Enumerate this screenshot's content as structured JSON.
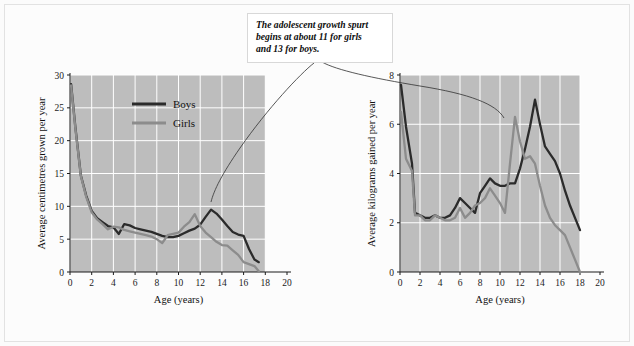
{
  "figure": {
    "background_color": "#fbfbfb",
    "frame_color": "#e2e2e2",
    "plot_background_color": "#bdbdbd",
    "gridline_color": "#ffffff",
    "boys_color": "#2b2b2b",
    "girls_color": "#8c8c8c"
  },
  "annotation": {
    "name": "growth-spurt-callout",
    "line1": "The adolescent growth spurt",
    "line2": "begins at about 11 for girls",
    "line3": "and 13 for boys."
  },
  "legend": {
    "boys_label": "Boys",
    "girls_label": "Girls"
  },
  "chart_data": [
    {
      "id": "height-velocity",
      "type": "line",
      "title": "",
      "xlabel": "Age (years)",
      "ylabel": "Average centimetres grown per year",
      "xlim": [
        0,
        20
      ],
      "ylim": [
        0,
        30
      ],
      "xticks": [
        0,
        2,
        4,
        6,
        8,
        10,
        12,
        14,
        16,
        18,
        20
      ],
      "yticks": [
        0,
        5,
        10,
        15,
        20,
        25,
        30
      ],
      "xtick_labels": [
        "0",
        "2",
        "4",
        "6",
        "8",
        "10",
        "12",
        "14",
        "16",
        "18",
        "20"
      ],
      "ytick_labels": [
        "0",
        "5",
        "10",
        "15",
        "20",
        "25",
        "30"
      ],
      "grid": true,
      "legend_position": "top-center",
      "plot_x_extent": [
        0,
        18
      ],
      "series": [
        {
          "name": "Boys",
          "color": "#2b2b2b",
          "x": [
            0.1,
            0.5,
            1.0,
            1.5,
            2.0,
            2.5,
            3.0,
            3.5,
            4.0,
            4.5,
            5.0,
            5.5,
            6.0,
            6.5,
            7.0,
            7.5,
            8.0,
            8.5,
            9.0,
            9.5,
            10.0,
            10.5,
            11.0,
            11.5,
            12.0,
            12.5,
            13.0,
            13.5,
            14.0,
            14.5,
            15.0,
            15.5,
            16.0,
            16.5,
            17.0,
            17.4
          ],
          "values": [
            28.6,
            22.0,
            14.7,
            11.6,
            9.3,
            8.2,
            7.6,
            7.0,
            6.8,
            5.8,
            7.3,
            7.1,
            6.7,
            6.5,
            6.3,
            6.1,
            5.8,
            5.5,
            5.3,
            5.3,
            5.5,
            5.9,
            6.3,
            6.6,
            7.2,
            8.4,
            9.5,
            8.9,
            8.0,
            7.0,
            6.1,
            5.7,
            5.5,
            3.5,
            1.9,
            1.5
          ]
        },
        {
          "name": "Girls",
          "color": "#8c8c8c",
          "x": [
            0.1,
            0.5,
            1.0,
            1.5,
            2.0,
            2.5,
            3.0,
            3.5,
            4.0,
            4.5,
            5.0,
            5.5,
            6.0,
            6.5,
            7.0,
            7.5,
            8.0,
            8.5,
            9.0,
            9.5,
            10.0,
            10.5,
            11.0,
            11.5,
            12.0,
            12.5,
            13.0,
            13.5,
            14.0,
            14.5,
            15.0,
            15.5,
            16.0,
            16.5,
            17.0,
            17.4
          ],
          "values": [
            28.4,
            21.8,
            14.6,
            11.4,
            9.1,
            8.0,
            7.3,
            6.5,
            6.9,
            6.8,
            6.4,
            6.2,
            6.0,
            5.8,
            5.6,
            5.4,
            5.0,
            4.4,
            5.6,
            5.8,
            6.0,
            6.9,
            7.6,
            8.8,
            7.0,
            6.0,
            5.3,
            4.6,
            4.1,
            4.0,
            3.3,
            2.6,
            1.5,
            1.2,
            0.9,
            0.1
          ]
        }
      ]
    },
    {
      "id": "weight-velocity",
      "type": "line",
      "title": "",
      "xlabel": "Age (years)",
      "ylabel": "Average kilograms gained per year",
      "xlim": [
        0,
        20
      ],
      "ylim": [
        0,
        8
      ],
      "xticks": [
        0,
        2,
        4,
        6,
        8,
        10,
        12,
        14,
        16,
        18,
        20
      ],
      "yticks": [
        0,
        2,
        4,
        6,
        8
      ],
      "xtick_labels": [
        "0",
        "2",
        "4",
        "6",
        "8",
        "10",
        "12",
        "14",
        "16",
        "18",
        "20"
      ],
      "ytick_labels": [
        "0",
        "2",
        "4",
        "6",
        "8"
      ],
      "grid": true,
      "legend_position": "none",
      "plot_x_extent": [
        0,
        18
      ],
      "series": [
        {
          "name": "Boys",
          "color": "#2b2b2b",
          "x": [
            0.1,
            0.6,
            1.2,
            1.5,
            2.0,
            2.5,
            3.0,
            3.5,
            4.0,
            4.5,
            5.0,
            5.5,
            6.0,
            6.5,
            7.0,
            7.5,
            8.0,
            8.5,
            9.0,
            9.5,
            10.0,
            10.5,
            11.0,
            11.5,
            12.0,
            12.5,
            13.0,
            13.5,
            14.0,
            14.5,
            15.0,
            15.5,
            16.0,
            16.5,
            17.0,
            17.5,
            18.0
          ],
          "values": [
            7.6,
            5.9,
            4.4,
            2.4,
            2.3,
            2.2,
            2.2,
            2.3,
            2.2,
            2.2,
            2.3,
            2.6,
            3.0,
            2.8,
            2.6,
            2.4,
            3.2,
            3.5,
            3.8,
            3.6,
            3.5,
            3.5,
            3.6,
            3.6,
            4.2,
            5.0,
            5.9,
            7.0,
            6.0,
            5.1,
            4.8,
            4.5,
            4.0,
            3.3,
            2.7,
            2.2,
            1.7
          ]
        },
        {
          "name": "Girls",
          "color": "#8c8c8c",
          "x": [
            0.1,
            0.6,
            1.2,
            1.5,
            2.0,
            2.5,
            3.0,
            3.5,
            4.0,
            4.5,
            5.0,
            5.5,
            6.0,
            6.5,
            7.0,
            7.5,
            8.0,
            8.5,
            9.0,
            9.5,
            10.0,
            10.5,
            11.0,
            11.5,
            12.0,
            12.5,
            13.0,
            13.5,
            14.0,
            14.5,
            15.0,
            15.5,
            16.0,
            16.5,
            17.0,
            17.5,
            18.0
          ],
          "values": [
            6.5,
            4.6,
            4.1,
            2.3,
            2.3,
            2.1,
            2.1,
            2.3,
            2.2,
            2.1,
            2.1,
            2.2,
            2.6,
            2.2,
            2.4,
            2.7,
            2.8,
            3.0,
            3.4,
            3.1,
            2.8,
            2.4,
            4.4,
            6.3,
            5.3,
            4.6,
            4.7,
            4.4,
            3.5,
            2.7,
            2.2,
            1.9,
            1.7,
            1.5,
            1.0,
            0.5,
            0.0
          ]
        }
      ]
    }
  ]
}
